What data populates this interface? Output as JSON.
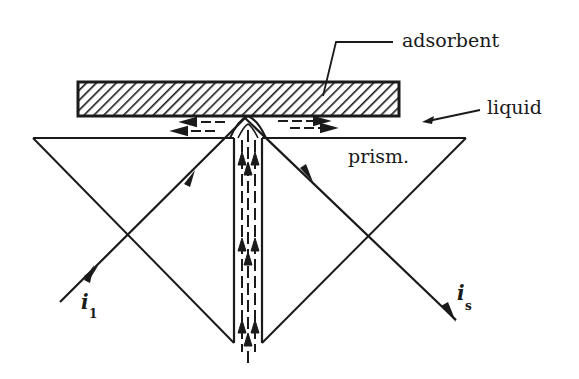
{
  "figure": {
    "type": "schematic",
    "description_visible": "Prism with adsorbent plate, liquid layer, incident and reflected beams, vertical flow channel",
    "colors": {
      "ink": "#1a1a1a",
      "background": "#ffffff"
    }
  },
  "labels": {
    "adsorbent": "adsorbent",
    "liquid": "liquid",
    "prism": "prism.",
    "incident_symbol": "i",
    "incident_subscript": "1",
    "reflected_symbol": "i",
    "reflected_subscript": "s"
  },
  "geometry": {
    "prism": {
      "top_left": [
        33,
        138
      ],
      "top_right": [
        466,
        138
      ],
      "apex": [
        247,
        357
      ]
    },
    "adsorbent_plate": {
      "x": 78,
      "y": 82,
      "width": 321,
      "height": 34
    },
    "reflection_point": [
      245,
      120
    ],
    "incident_beam": {
      "from": [
        60,
        302
      ],
      "to": [
        245,
        120
      ]
    },
    "reflected_beam": {
      "from": [
        245,
        120
      ],
      "to": [
        456,
        320
      ]
    },
    "channel": {
      "left": 234,
      "right": 262,
      "top": 140,
      "bottom": 357
    }
  }
}
